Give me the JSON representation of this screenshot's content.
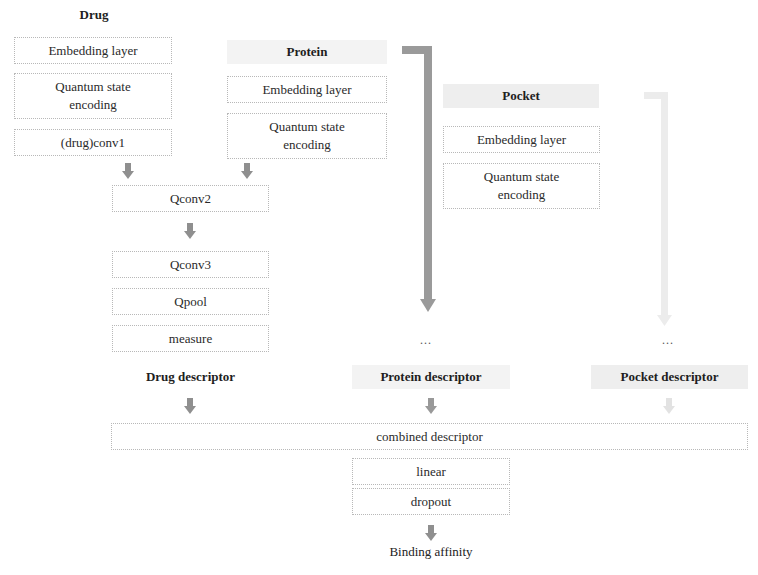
{
  "drug": {
    "header": "Drug",
    "embedding": "Embedding layer",
    "quantum": "Quantum state encoding",
    "conv1": "(drug)conv1",
    "descriptor": "Drug descriptor"
  },
  "protein": {
    "header": "Protein",
    "embedding": "Embedding layer",
    "quantum": "Quantum state encoding",
    "ellipsis": "...",
    "descriptor": "Protein descriptor"
  },
  "pocket": {
    "header": "Pocket",
    "embedding": "Embedding layer",
    "quantum": "Quantum state encoding",
    "ellipsis": "...",
    "descriptor": "Pocket descriptor"
  },
  "shared": {
    "qconv2": "Qconv2",
    "qconv3": "Qconv3",
    "qpool": "Qpool",
    "measure": "measure"
  },
  "head": {
    "combined": "combined descriptor",
    "linear": "linear",
    "dropout": "dropout",
    "output": "Binding affinity"
  },
  "colors": {
    "arrow_dark": "#8f8f8f",
    "arrow_light": "#e6e6e6",
    "header_shade": "#eeeeee",
    "border": "#b8b8b8"
  }
}
